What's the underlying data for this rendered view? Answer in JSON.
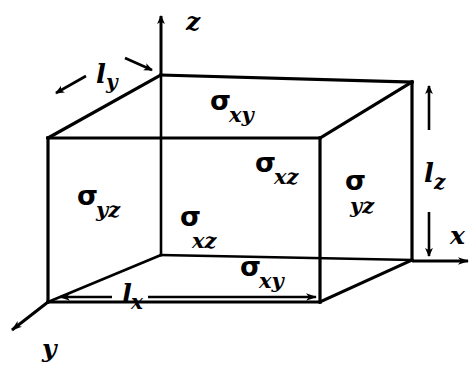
{
  "figure": {
    "type": "3d-box-diagram",
    "background_color": "#ffffff",
    "line_color": "#000000"
  },
  "axes": [
    {
      "name": "z-axis",
      "label": "z",
      "direction": "up",
      "label_x": 186,
      "label_y": 30
    },
    {
      "name": "x-axis",
      "label": "x",
      "direction": "right",
      "label_x": 450,
      "label_y": 244
    },
    {
      "name": "y-axis",
      "label": "y",
      "direction": "down-left",
      "label_x": 42,
      "label_y": 357
    }
  ],
  "face_labels": [
    {
      "name": "top-face",
      "symbol": "σ",
      "subscript": "xy",
      "x": 210,
      "y": 110,
      "sub_dx": 19,
      "sub_dy": 12
    },
    {
      "name": "bottom-face",
      "symbol": "σ",
      "subscript": "xy",
      "x": 240,
      "y": 276,
      "sub_dx": 19,
      "sub_dy": 12
    },
    {
      "name": "left-face",
      "symbol": "σ",
      "subscript": "yz",
      "x": 77,
      "y": 205,
      "sub_dx": 19,
      "sub_dy": 12
    },
    {
      "name": "right-face",
      "symbol": "σ",
      "subscript": "yz",
      "x": 345,
      "y": 190,
      "sub_dx": 19,
      "sub_dy": 22
    },
    {
      "name": "back-face",
      "symbol": "σ",
      "subscript": "xz",
      "x": 255,
      "y": 172,
      "sub_dx": 19,
      "sub_dy": 12
    },
    {
      "name": "front-face",
      "symbol": "σ",
      "subscript": "xz",
      "x": 180,
      "y": 226,
      "sub_dx": 19,
      "sub_dy": 19
    }
  ],
  "dimension_labels": [
    {
      "name": "length-x",
      "symbol": "l",
      "subscript": "x",
      "x": 122,
      "y": 302,
      "sub_dx": 10,
      "sub_dy": 6
    },
    {
      "name": "length-y",
      "symbol": "l",
      "subscript": "y",
      "x": 96,
      "y": 83,
      "sub_dx": 10,
      "sub_dy": 6
    },
    {
      "name": "length-z",
      "symbol": "l",
      "subscript": "z",
      "x": 424,
      "y": 182,
      "sub_dx": 10,
      "sub_dy": 6
    }
  ],
  "geometry": {
    "front_bottom_left": [
      48,
      302
    ],
    "front_top_left": [
      48,
      138
    ],
    "back_top_left": [
      161,
      75
    ],
    "back_bottom_left": [
      161,
      255
    ],
    "front_bottom_right": [
      320,
      302
    ],
    "front_top_right": [
      320,
      138
    ],
    "back_top_right": [
      412,
      82
    ],
    "back_bottom_right": [
      412,
      260
    ]
  }
}
